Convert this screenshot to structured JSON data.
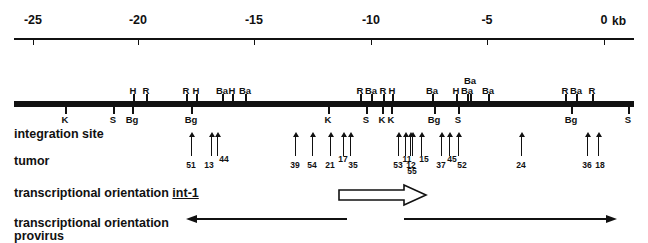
{
  "figure": {
    "unit_label": "kb",
    "scale": {
      "ticks": [
        {
          "label": "-25",
          "kb": -25,
          "x": 33
        },
        {
          "label": "-20",
          "kb": -20,
          "x": 138
        },
        {
          "label": "-15",
          "kb": -15,
          "x": 254
        },
        {
          "label": "-10",
          "kb": -10,
          "x": 371
        },
        {
          "label": "-5",
          "kb": -5,
          "x": 487
        },
        {
          "label": "0",
          "kb": 0,
          "x": 604
        }
      ],
      "axis_start_x": 14,
      "axis_end_x": 634
    },
    "row_titles": {
      "integration_site": "integration site",
      "tumor": "tumor",
      "orientation_int1_prefix": "transcriptional orientation ",
      "orientation_int1_gene": "int-1",
      "orientation_provirus_line1": "transcriptional orientation",
      "orientation_provirus_line2": "provirus"
    },
    "restriction_sites_above": [
      {
        "label": "H",
        "x": 133
      },
      {
        "label": "R",
        "x": 146
      },
      {
        "label": "R",
        "x": 186
      },
      {
        "label": "H",
        "x": 196
      },
      {
        "label": "Ba",
        "x": 222
      },
      {
        "label": "H",
        "x": 232
      },
      {
        "label": "Ba",
        "x": 245
      },
      {
        "label": "R",
        "x": 360
      },
      {
        "label": "Ba",
        "x": 371
      },
      {
        "label": "R",
        "x": 383
      },
      {
        "label": "H",
        "x": 392
      },
      {
        "label": "Ba",
        "x": 432
      },
      {
        "label": "H",
        "x": 456
      },
      {
        "label": "Ba",
        "x": 467
      },
      {
        "label": "Ba",
        "x": 470,
        "stacked_above": true
      },
      {
        "label": "Ba",
        "x": 488
      },
      {
        "label": "R",
        "x": 565
      },
      {
        "label": "Ba",
        "x": 576
      },
      {
        "label": "R",
        "x": 592
      }
    ],
    "integration_sites_below": [
      {
        "label": "K",
        "x": 65
      },
      {
        "label": "S",
        "x": 113
      },
      {
        "label": "Bg",
        "x": 132
      },
      {
        "label": "Bg",
        "x": 191
      },
      {
        "label": "K",
        "x": 328
      },
      {
        "label": "S",
        "x": 366
      },
      {
        "label": "K",
        "x": 382
      },
      {
        "label": "K",
        "x": 391
      },
      {
        "label": "Bg",
        "x": 434
      },
      {
        "label": "S",
        "x": 458
      },
      {
        "label": "Bg",
        "x": 571
      },
      {
        "label": "S",
        "x": 628
      }
    ],
    "tumors": [
      {
        "number": "51",
        "x": 191,
        "label_x": 191,
        "label_y": 160,
        "arrow_top": 136,
        "arrow_height": 20
      },
      {
        "number": "13",
        "x": 211,
        "label_x": 209,
        "label_y": 160,
        "arrow_top": 136,
        "arrow_height": 20
      },
      {
        "number": "44",
        "x": 217,
        "label_x": 224,
        "label_y": 154,
        "arrow_top": 136,
        "arrow_height": 20
      },
      {
        "number": "39",
        "x": 295,
        "label_x": 295,
        "label_y": 160,
        "arrow_top": 136,
        "arrow_height": 20
      },
      {
        "number": "54",
        "x": 312,
        "label_x": 312,
        "label_y": 160,
        "arrow_top": 136,
        "arrow_height": 20
      },
      {
        "number": "21",
        "x": 330,
        "label_x": 330,
        "label_y": 160,
        "arrow_top": 136,
        "arrow_height": 20
      },
      {
        "number": "17",
        "x": 343,
        "label_x": 343,
        "label_y": 154,
        "arrow_top": 136,
        "arrow_height": 20
      },
      {
        "number": "35",
        "x": 350,
        "label_x": 353,
        "label_y": 160,
        "arrow_top": 136,
        "arrow_height": 20
      },
      {
        "number": "53",
        "x": 398,
        "label_x": 398,
        "label_y": 160,
        "arrow_top": 136,
        "arrow_height": 20
      },
      {
        "number": "11",
        "x": 405,
        "label_x": 407,
        "label_y": 154,
        "arrow_top": 136,
        "arrow_height": 20
      },
      {
        "number": "12",
        "x": 410,
        "label_x": 411,
        "label_y": 160,
        "arrow_top": 136,
        "arrow_height": 20
      },
      {
        "number": "55",
        "x": 412,
        "label_x": 412,
        "label_y": 166,
        "arrow_top": 136,
        "arrow_height": 20
      },
      {
        "number": "15",
        "x": 421,
        "label_x": 424,
        "label_y": 154,
        "arrow_top": 136,
        "arrow_height": 20
      },
      {
        "number": "37",
        "x": 441,
        "label_x": 441,
        "label_y": 160,
        "arrow_top": 136,
        "arrow_height": 20
      },
      {
        "number": "45",
        "x": 449,
        "label_x": 452,
        "label_y": 154,
        "arrow_top": 136,
        "arrow_height": 20
      },
      {
        "number": "52",
        "x": 458,
        "label_x": 462,
        "label_y": 160,
        "arrow_top": 136,
        "arrow_height": 20
      },
      {
        "number": "24",
        "x": 521,
        "label_x": 521,
        "label_y": 160,
        "arrow_top": 136,
        "arrow_height": 20
      },
      {
        "number": "36",
        "x": 587,
        "label_x": 587,
        "label_y": 160,
        "arrow_top": 136,
        "arrow_height": 20
      },
      {
        "number": "18",
        "x": 598,
        "label_x": 600,
        "label_y": 160,
        "arrow_top": 136,
        "arrow_height": 20
      }
    ],
    "int1_arrow": {
      "direction": "right",
      "x_start": 338,
      "x_end": 425
    },
    "provirus_arrows": [
      {
        "direction": "left",
        "x_start": 186,
        "x_end": 345
      },
      {
        "direction": "right",
        "x_start": 403,
        "x_end": 614
      }
    ],
    "colors": {
      "ink": "#111111",
      "background": "#ffffff"
    }
  }
}
